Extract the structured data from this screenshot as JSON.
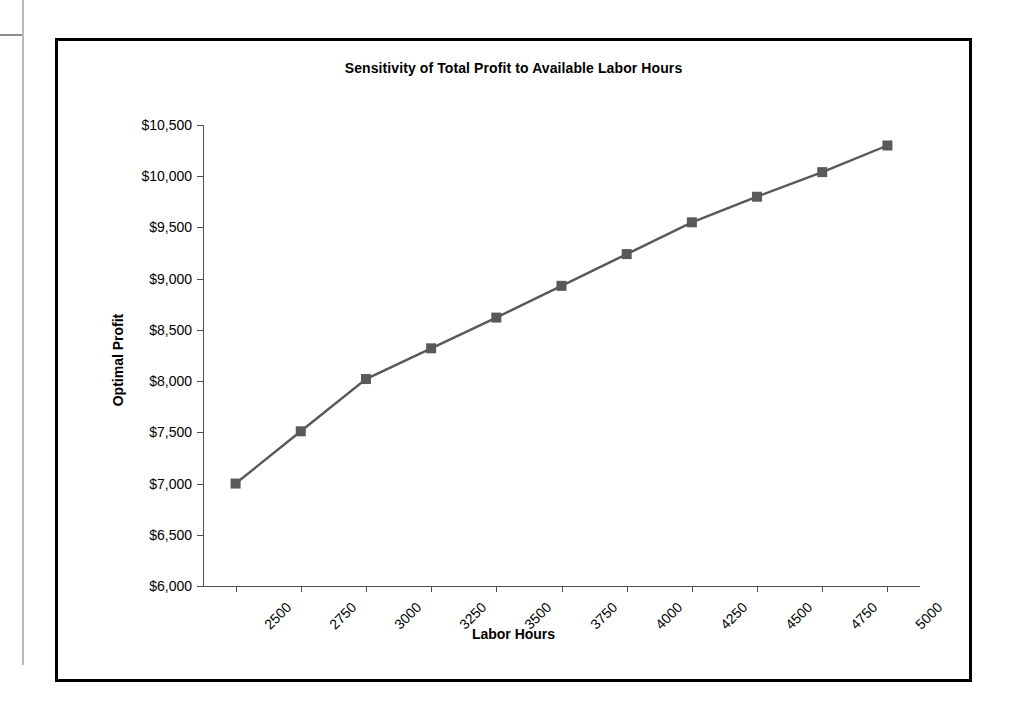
{
  "chart_data": {
    "type": "line",
    "title": "Sensitivity of Total Profit to Available Labor Hours",
    "xlabel": "Labor Hours",
    "ylabel": "Optimal Profit",
    "categories": [
      2500,
      2750,
      3000,
      3250,
      3500,
      3750,
      4000,
      4250,
      4500,
      4750,
      5000
    ],
    "category_labels": [
      "2500",
      "2750",
      "3000",
      "3250",
      "3500",
      "3750",
      "4000",
      "4250",
      "4500",
      "4750",
      "5000"
    ],
    "values": [
      7000,
      7510,
      8020,
      8320,
      8620,
      8930,
      9240,
      9550,
      9800,
      10040,
      10300
    ],
    "ylim": [
      6000,
      10500
    ],
    "ytick_values": [
      6000,
      6500,
      7000,
      7500,
      8000,
      8500,
      9000,
      9500,
      10000,
      10500
    ],
    "ytick_labels": [
      "$6,000",
      "$6,500",
      "$7,000",
      "$7,500",
      "$8,000",
      "$8,500",
      "$9,000",
      "$9,500",
      "$10,000",
      "$10,500"
    ],
    "grid": false,
    "legend": false,
    "marker": "square",
    "series_color": "#595959",
    "axis_color": "#4d4d4d",
    "border_color": "#000000",
    "background": "#ffffff"
  },
  "artifacts": {
    "ghost_text_1": "",
    "ghost_text_2": ""
  }
}
